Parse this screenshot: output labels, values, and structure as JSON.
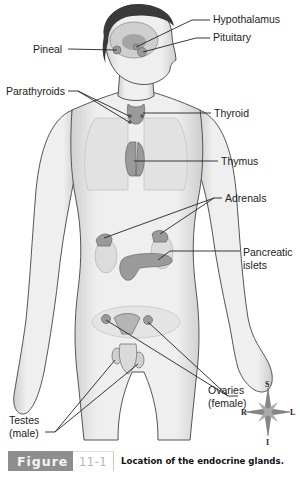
{
  "labels": {
    "hypothalamus": "Hypothalamus",
    "pituitary": "Pituitary",
    "pineal": "Pineal",
    "parathyroids": "Parathyroids",
    "thyroid": "Thyroid",
    "thymus": "Thymus",
    "adrenals": "Adrenals",
    "pancreatic_1": "Pancreatic",
    "pancreatic_2": "islets",
    "ovaries_1": "Ovaries",
    "ovaries_2": "(female)",
    "testes_1": "Testes",
    "testes_2": "(male)"
  },
  "compass": {
    "top": "S",
    "bottom": "I",
    "left": "R",
    "right": "L"
  },
  "caption": {
    "figure_word": "Figure",
    "figure_number": "11-1",
    "text": "Location of the endocrine glands."
  },
  "colors": {
    "skin": "#ededed",
    "outline": "#4a4a4a",
    "gland": "#9a9a9a",
    "hair": "#3a3a3a",
    "figure_box": "#8e8e8e"
  }
}
